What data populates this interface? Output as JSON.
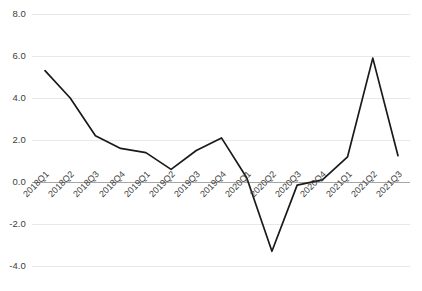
{
  "chart_data": {
    "type": "line",
    "title": "",
    "subtitle": "",
    "xlabel": "",
    "ylabel": "",
    "categories": [
      "2018Q1",
      "2018Q2",
      "2018Q3",
      "2018Q4",
      "2019Q1",
      "2019Q2",
      "2019Q3",
      "2019Q4",
      "2020Q1",
      "2020Q2",
      "2020Q3",
      "2020Q4",
      "2021Q1",
      "2021Q2",
      "2021Q3"
    ],
    "values": [
      5.3,
      4.0,
      2.2,
      1.6,
      1.4,
      0.6,
      1.5,
      2.1,
      0.2,
      -3.3,
      -0.15,
      0.1,
      1.2,
      5.9,
      1.25
    ],
    "series": [
      {
        "name": "",
        "values": [
          5.3,
          4.0,
          2.2,
          1.6,
          1.4,
          0.6,
          1.5,
          2.1,
          0.2,
          -3.3,
          -0.15,
          0.1,
          1.2,
          5.9,
          1.25
        ]
      }
    ],
    "ylim": [
      -4.0,
      8.0
    ],
    "ytick_labels": [
      "8.0",
      "6.0",
      "4.0",
      "2.0",
      "0.0",
      "-2.0",
      "-4.0"
    ],
    "ytick_values": [
      8.0,
      6.0,
      4.0,
      2.0,
      0.0,
      -2.0,
      -4.0
    ],
    "grid": true,
    "legend": "none",
    "line_color": "#1a1a1a",
    "grid_color": "#e8e8e8",
    "zero_axis_color": "#a6a6a6",
    "background_color": "#ffffff",
    "xtick_rotation": -45
  }
}
